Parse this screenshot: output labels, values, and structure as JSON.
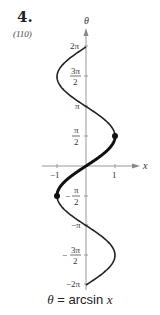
{
  "exercise": {
    "number": "4.",
    "reference": "(110)"
  },
  "caption": {
    "lhs": "θ",
    "eq": " = ",
    "fn": "arcsin ",
    "var": "x"
  },
  "chart_data": {
    "type": "line",
    "title": "θ = arcsin x",
    "xlabel": "x",
    "ylabel": "θ",
    "xlim": [
      -1.2,
      1.6
    ],
    "ylim": [
      -6.283,
      6.283
    ],
    "x_ticks": [
      "-1",
      "1"
    ],
    "y_ticks": [
      "2π",
      "3π/2",
      "π",
      "π/2",
      "-π/2",
      "-π",
      "-3π/2",
      "-2π"
    ],
    "series": [
      {
        "name": "x = sin θ (full relation)",
        "style": "thin",
        "theta_range": [
          -6.283,
          6.283
        ]
      },
      {
        "name": "θ = arcsin x (principal branch)",
        "style": "thick",
        "theta_range": [
          -1.571,
          1.571
        ]
      }
    ],
    "points": [
      {
        "x": 1,
        "y": 1.571
      },
      {
        "x": -1,
        "y": -1.571
      }
    ]
  },
  "labels": {
    "theta": "θ",
    "x": "x",
    "xm1": "−1",
    "x1": "1",
    "y2pi": "2π",
    "y3pi_num": "3π",
    "y3pi_den": "2",
    "ypi": "π",
    "ypi2_num": "π",
    "ypi2_den": "2",
    "ympi2_num": "π",
    "ympi2_den": "2",
    "ympi": "−π",
    "ym3pi_num": "3π",
    "ym3pi_den": "2",
    "ym2pi": "−2π"
  }
}
